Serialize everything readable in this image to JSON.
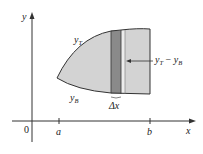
{
  "diagram": {
    "axes": {
      "x_label": "x",
      "y_label": "y",
      "origin_label": "0",
      "ticks": [
        {
          "label": "a"
        },
        {
          "label": "b"
        }
      ]
    },
    "curves": {
      "top_label": "y",
      "top_sub": "T",
      "bottom_label": "y",
      "bottom_sub": "B"
    },
    "strip": {
      "width_label": "Δx",
      "height_label_main1": "y",
      "height_label_sub1": "T",
      "height_label_op": " − ",
      "height_label_main2": "y",
      "height_label_sub2": "B"
    },
    "colors": {
      "region_fill": "#d3d3d3",
      "strip_fill": "#8a8a8a",
      "thin_strip_fill": "#ececec",
      "outline": "#333333"
    }
  }
}
